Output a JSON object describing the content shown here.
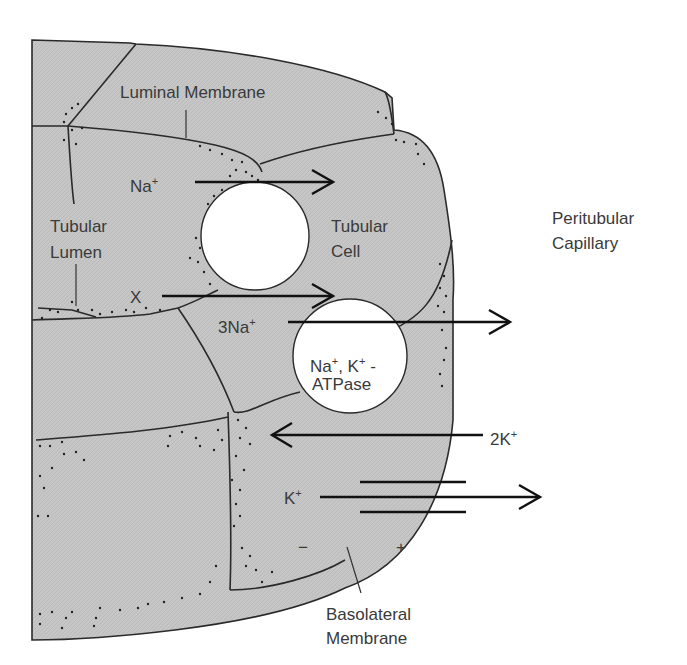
{
  "figure": {
    "background_color": "#ffffff",
    "tissue_color": "#c4c4c4",
    "line_color": "#2a2a2a"
  },
  "labels": {
    "luminal_membrane": "Luminal Membrane",
    "tubular_lumen_line1": "Tubular",
    "tubular_lumen_line2": "Lumen",
    "tubular_cell_line1": "Tubular",
    "tubular_cell_line2": "Cell",
    "peritubular_line1": "Peritubular",
    "peritubular_line2": "Capillary",
    "basolateral_line1": "Basolateral",
    "basolateral_line2": "Membrane"
  },
  "transport": {
    "na_in": {
      "ion": "Na",
      "charge": "+",
      "direction": "lumen-to-cell"
    },
    "x_in": {
      "ion": "X",
      "direction": "lumen-to-cell"
    },
    "na_out": {
      "ion": "3Na",
      "charge": "+",
      "direction": "cell-to-capillary"
    },
    "k_in": {
      "ion": "2K",
      "charge": "+",
      "direction": "capillary-to-cell"
    },
    "k_leak": {
      "ion": "K",
      "charge": "+",
      "direction": "cell-to-capillary"
    }
  },
  "pump": {
    "line1_a": "Na",
    "line1_a_charge": "+",
    "line1_sep": ", K",
    "line1_b_charge": "+",
    "line1_tail": " -",
    "line2": "ATPase"
  },
  "potential": {
    "inside": "−",
    "outside": "+"
  }
}
